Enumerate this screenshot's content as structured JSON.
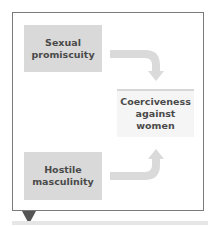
{
  "diagram": {
    "type": "flow",
    "nodes": [
      {
        "id": "sexual_promiscuity",
        "label": "Sexual\npromiscuity",
        "style": "predictor"
      },
      {
        "id": "hostile_masculinity",
        "label": "Hostile\nmasculinity",
        "style": "predictor"
      },
      {
        "id": "coerciveness",
        "label": "Coerciveness\nagainst\nwomen",
        "style": "outcome"
      }
    ],
    "edges": [
      {
        "from": "sexual_promiscuity",
        "to": "coerciveness"
      },
      {
        "from": "hostile_masculinity",
        "to": "coerciveness"
      }
    ],
    "colors": {
      "frame_border": "#7a7a7a",
      "predictor_fill": "#d9d9d9",
      "outcome_fill": "#f5f5f5",
      "outcome_top_border": "#d6d6d6",
      "arrow": "#dadada",
      "text": "#4a4a4a",
      "pointer": "#555555"
    }
  }
}
